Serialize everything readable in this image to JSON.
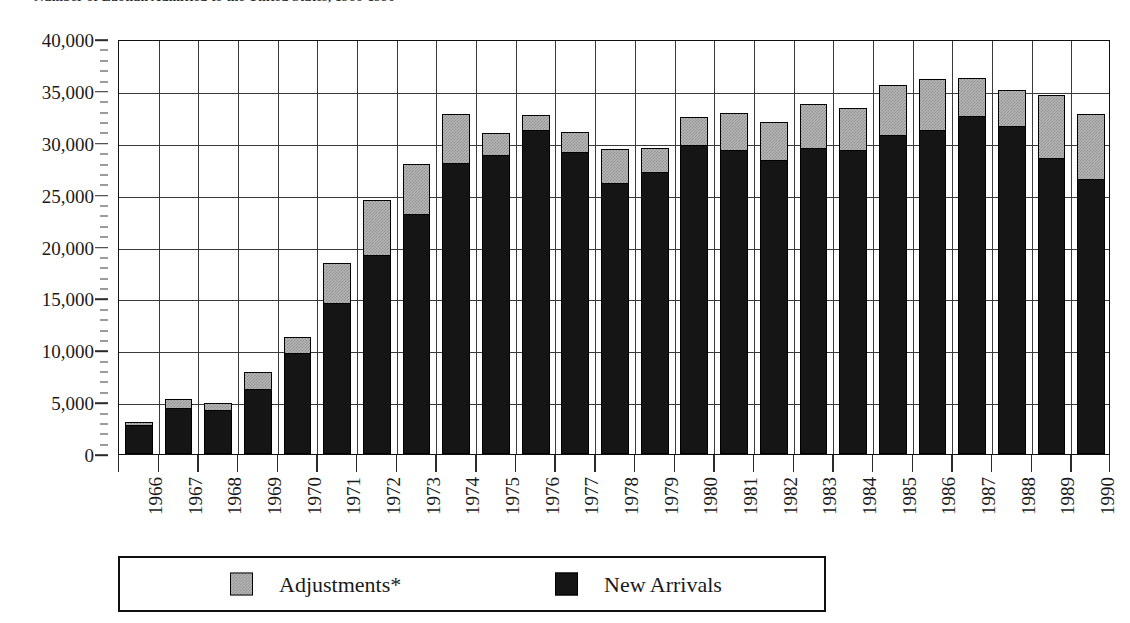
{
  "chart_data": {
    "type": "bar",
    "subtype": "stacked-vertical",
    "title": "Number of Laotian Admitted to the United States, 1966-1990",
    "xlabel": "",
    "ylabel": "",
    "ylim": [
      0,
      40000
    ],
    "ytick_values": [
      0,
      5000,
      10000,
      15000,
      20000,
      25000,
      30000,
      35000,
      40000
    ],
    "ytick_labels": [
      "0",
      "5,000",
      "10,000",
      "15,000",
      "20,000",
      "25,000",
      "30,000",
      "35,000",
      "40,000"
    ],
    "y_minor_tick_step": 1000,
    "grid": "horizontal-and-vertical",
    "legend_position": "bottom",
    "categories": [
      "1966",
      "1967",
      "1968",
      "1969",
      "1970",
      "1971",
      "1972",
      "1973",
      "1974",
      "1975",
      "1976",
      "1977",
      "1978",
      "1979",
      "1980",
      "1981",
      "1982",
      "1983",
      "1984",
      "1985",
      "1986",
      "1987",
      "1988",
      "1989",
      "1990"
    ],
    "series": [
      {
        "name": "New Arrivals",
        "color": "#151515",
        "values": [
          2700,
          4300,
          4100,
          6200,
          9600,
          14500,
          19100,
          23000,
          28000,
          28700,
          31100,
          29000,
          26000,
          27100,
          29700,
          29200,
          28200,
          29400,
          29200,
          30700,
          31100,
          32500,
          31500,
          28400,
          26400
        ]
      },
      {
        "name": "Adjustments*",
        "color": "#b9b9b9",
        "values": [
          400,
          1000,
          800,
          1700,
          1700,
          3900,
          5400,
          5000,
          4800,
          2200,
          1600,
          2000,
          3400,
          2400,
          2800,
          3700,
          3800,
          4300,
          4200,
          4900,
          5000,
          3700,
          3600,
          6200,
          6400
        ]
      }
    ],
    "totals": [
      3100,
      5300,
      4900,
      7900,
      11300,
      18400,
      24500,
      28000,
      32800,
      30900,
      32700,
      31000,
      29400,
      29500,
      32500,
      32900,
      32000,
      33700,
      33400,
      35600,
      36100,
      36200,
      35100,
      34600,
      32800
    ]
  },
  "legend": {
    "items": [
      {
        "label": "Adjustments*",
        "swatch": "adjustments-swatch"
      },
      {
        "label": "New Arrivals",
        "swatch": "new-arrivals-swatch"
      }
    ]
  }
}
